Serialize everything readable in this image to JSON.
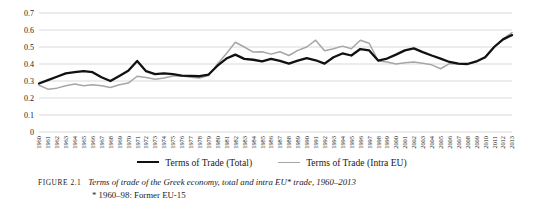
{
  "figure": {
    "tag": "FIGURE 2.1",
    "caption": "Terms of trade of the Greek economy, total and intra EU* trade, 1960–2013",
    "note": "* 1960–98: Former EU-15"
  },
  "legend": {
    "position": "bottom-center",
    "entries": [
      {
        "label": "Terms of Trade (Total)",
        "color": "#111111"
      },
      {
        "label": "Terms of Trade (Intra EU)",
        "color": "#a6a6a6"
      }
    ]
  },
  "chart_data": {
    "type": "line",
    "title": "",
    "xlabel": "",
    "ylabel": "",
    "ylim": [
      0,
      0.7
    ],
    "ytick_labels": [
      "0.7",
      "0.6",
      "0.5",
      "0.4",
      "0.3",
      "0.2",
      "0.1",
      "0"
    ],
    "yticks": [
      0.7,
      0.6,
      0.5,
      0.4,
      0.3,
      0.2,
      0.1,
      0
    ],
    "grid": true,
    "grid_color": "#cfcfcf",
    "x": [
      1960,
      1961,
      1962,
      1963,
      1964,
      1965,
      1966,
      1967,
      1968,
      1969,
      1970,
      1971,
      1972,
      1973,
      1974,
      1975,
      1976,
      1977,
      1978,
      1979,
      1980,
      1981,
      1982,
      1983,
      1984,
      1985,
      1986,
      1987,
      1988,
      1989,
      1990,
      1991,
      1992,
      1993,
      1994,
      1995,
      1996,
      1997,
      1998,
      1999,
      2000,
      2001,
      2002,
      2003,
      2004,
      2005,
      2006,
      2007,
      2008,
      2009,
      2010,
      2011,
      2012,
      2013
    ],
    "xtick_labels": [
      "1960",
      "1961",
      "1962",
      "1963",
      "1964",
      "1965",
      "1966",
      "1967",
      "1968",
      "1969",
      "1970",
      "1971",
      "1972",
      "1973",
      "1974",
      "1975",
      "1976",
      "1977",
      "1978",
      "1979",
      "1980",
      "1981",
      "1982",
      "1983",
      "1984",
      "1985",
      "1986",
      "1987",
      "1988",
      "1989",
      "1990",
      "1991",
      "1992",
      "1993",
      "1994",
      "1995",
      "1996",
      "1997",
      "1998",
      "1999",
      "2000",
      "2001",
      "2002",
      "2003",
      "2004",
      "2005",
      "2006",
      "2007",
      "2008",
      "2009",
      "2010",
      "2011",
      "2012",
      "2013"
    ],
    "series": [
      {
        "name": "Terms of Trade (Total)",
        "color": "#111111",
        "width": 2.3,
        "values": [
          0.285,
          0.305,
          0.325,
          0.345,
          0.352,
          0.358,
          0.352,
          0.322,
          0.3,
          0.33,
          0.36,
          0.418,
          0.358,
          0.34,
          0.345,
          0.34,
          0.332,
          0.33,
          0.328,
          0.338,
          0.39,
          0.432,
          0.455,
          0.43,
          0.425,
          0.415,
          0.43,
          0.418,
          0.402,
          0.42,
          0.435,
          0.422,
          0.402,
          0.44,
          0.462,
          0.45,
          0.488,
          0.48,
          0.42,
          0.432,
          0.455,
          0.48,
          0.492,
          0.47,
          0.45,
          0.432,
          0.412,
          0.402,
          0.4,
          0.415,
          0.44,
          0.5,
          0.545,
          0.57
        ]
      },
      {
        "name": "Terms of Trade (Intra EU)",
        "color": "#a6a6a6",
        "width": 1.5,
        "values": [
          0.275,
          0.252,
          0.258,
          0.272,
          0.282,
          0.272,
          0.278,
          0.272,
          0.262,
          0.278,
          0.288,
          0.328,
          0.32,
          0.31,
          0.318,
          0.33,
          0.33,
          0.322,
          0.318,
          0.332,
          0.4,
          0.462,
          0.528,
          0.5,
          0.47,
          0.472,
          0.458,
          0.472,
          0.45,
          0.48,
          0.5,
          0.54,
          0.478,
          0.49,
          0.505,
          0.49,
          0.54,
          0.522,
          0.418,
          0.412,
          0.4,
          0.408,
          0.412,
          0.405,
          0.395,
          0.372,
          0.402,
          0.4,
          0.398,
          0.412,
          0.442,
          0.5,
          0.548,
          0.585
        ]
      }
    ]
  }
}
